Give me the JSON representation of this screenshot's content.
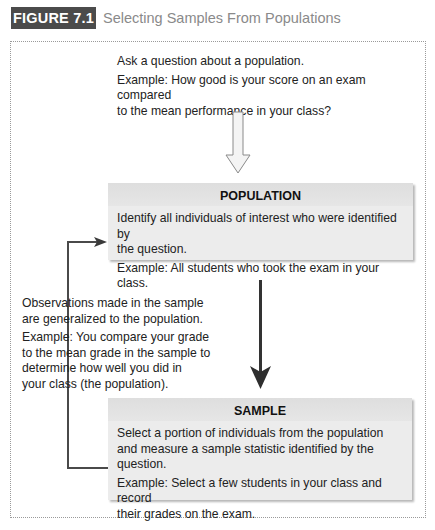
{
  "figure": {
    "label": "FIGURE 7.1",
    "title": "Selecting Samples From Populations"
  },
  "question": {
    "line1": "Ask a question about a population.",
    "example_line1": "Example: How good is your score on an exam compared",
    "example_line2": "to the mean performance in your class?"
  },
  "population": {
    "heading": "POPULATION",
    "text_line1": "Identify all individuals of interest who were identified by",
    "text_line2": "the question.",
    "example": "Example: All students who took the exam in your class."
  },
  "generalize": {
    "line1": "Observations made in the sample",
    "line2": "are generalized to the population.",
    "example_line1": "Example: You compare your grade",
    "example_line2": "to the mean grade in the sample to",
    "example_line3": "determine how well you did in",
    "example_line4": "your class (the population)."
  },
  "sample": {
    "heading": "SAMPLE",
    "text_line1": "Select a portion of individuals from the population",
    "text_line2": "and measure a sample statistic identified by the question.",
    "example_line1": "Example: Select a few students in your class and record",
    "example_line2": "their grades on the exam."
  },
  "arrows": {
    "question_to_population": "hollow-down-arrow",
    "population_to_sample": "solid-down-arrow",
    "sample_to_population": "feedback-arrow"
  },
  "colors": {
    "label_bg": "#4b4b4b",
    "box_bg": "#ececec",
    "arrow": "#3a3a3a",
    "title": "#8a8a8a"
  }
}
